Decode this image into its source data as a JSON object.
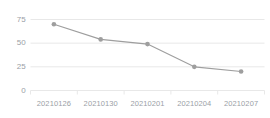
{
  "chart_data": {
    "type": "line",
    "title": "",
    "subtitle": "",
    "xlabel": "",
    "ylabel": "",
    "categories": [
      "20210126",
      "20210130",
      "20210201",
      "20210204",
      "20210207"
    ],
    "values": [
      70,
      54,
      49,
      25,
      20
    ],
    "series": [
      {
        "name": "",
        "values": [
          70,
          54,
          49,
          25,
          20
        ]
      }
    ],
    "ylim": [
      0,
      75
    ],
    "yticks": [
      0,
      25,
      50,
      75
    ],
    "ytick_labels": [
      "0",
      "25",
      "50",
      "75"
    ],
    "grid": true,
    "grid_axis": "y",
    "legend": false,
    "legend_position": "none",
    "marker": "circle",
    "colors": {
      "line": "#9e9e9e",
      "marker": "#9e9e9e",
      "grid": "#e8e8e8",
      "tick_text": "#9aa0a6",
      "background": "#ffffff"
    }
  }
}
